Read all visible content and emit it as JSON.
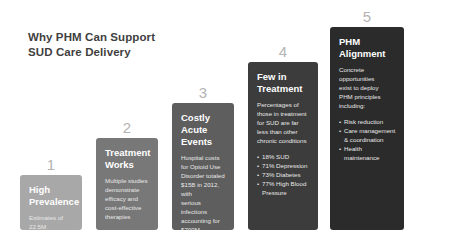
{
  "slide": {
    "title": "Why PHM Can Support\nSUD Care Delivery",
    "background_color": "#ffffff"
  },
  "chart_data": {
    "type": "bar",
    "title": "Why PHM Can Support SUD Care Delivery",
    "xlabel": "",
    "ylabel": "",
    "grid": false,
    "legend_position": "none",
    "categories": [
      "High Prevalence",
      "Treatment Works",
      "Costly Acute Events",
      "Few in Treatment",
      "PHM Alignment"
    ],
    "values": [
      1,
      2,
      3,
      4,
      5
    ],
    "step_numbers": [
      "1",
      "2",
      "3",
      "4",
      "5"
    ],
    "bar_colors": [
      "#a8a8a8",
      "#787878",
      "#5e5e5e",
      "#3c3c3c",
      "#2b2b2b"
    ],
    "number_color": "#b4b4b4"
  },
  "steps": [
    {
      "number": "1",
      "title": "High\nPrevalence",
      "body": "Estimates of\n22.5M",
      "bullets": []
    },
    {
      "number": "2",
      "title": "Treatment\nWorks",
      "body": "Multiple studies\ndemonstrate\nefficacy and\ncost-effective\ntherapies",
      "bullets": []
    },
    {
      "number": "3",
      "title": "Costly\nAcute\nEvents",
      "body": "Hospital costs\nfor Opioid Use\nDisorder totaled\n$15B in 2012, with\nserious infections\naccounting for\n$700M",
      "bullets": []
    },
    {
      "number": "4",
      "title": "Few in\nTreatment",
      "body": "Percentages of\nthose in treatment\nfor SUD are far\nless than other\nchronic conditions",
      "bullets": [
        "18% SUD",
        "71% Depression",
        "73% Diabetes",
        "77% High Blood\n  Pressure"
      ]
    },
    {
      "number": "5",
      "title": "PHM\nAlignment",
      "body": "Concrete\nopportunities\nexist to deploy\nPHM principles\nincluding:",
      "bullets": [
        "Risk reduction",
        "Care management\n  & coordination",
        "Health\n  maintenance"
      ]
    }
  ]
}
